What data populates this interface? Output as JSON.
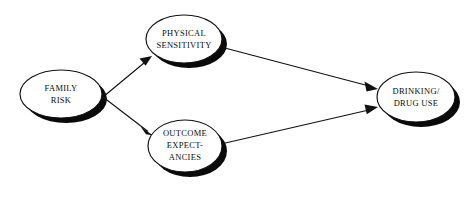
{
  "diagram": {
    "type": "path-diagram",
    "background_color": "#ffffff",
    "stroke_color": "#111111",
    "shadow_color": "#0a0a0a",
    "text_color": "#0d0d0d",
    "nodes": [
      {
        "id": "family-risk",
        "lines": [
          "FAMILY",
          "RISK"
        ],
        "cx": 61,
        "cy": 94,
        "rx": 41,
        "ry": 24,
        "shadow_dx": 5,
        "shadow_dy": 5
      },
      {
        "id": "physical-sensitivity",
        "lines": [
          "PHYSICAL",
          "SENSITIVITY"
        ],
        "cx": 184,
        "cy": 39,
        "rx": 38,
        "ry": 24,
        "shadow_dx": 5,
        "shadow_dy": 5
      },
      {
        "id": "outcome-expectancies",
        "lines": [
          "OUTCOME",
          "EXPECT-",
          "ANCIES"
        ],
        "cx": 185,
        "cy": 146,
        "rx": 37,
        "ry": 26,
        "shadow_dx": 5,
        "shadow_dy": 5
      },
      {
        "id": "drinking-drug-use",
        "lines": [
          "DRINKING/",
          "DRUG USE"
        ],
        "cx": 416,
        "cy": 97,
        "rx": 39,
        "ry": 25,
        "shadow_dx": 5,
        "shadow_dy": 5
      }
    ],
    "edges": [
      {
        "id": "family-risk-to-physical-sensitivity",
        "from": "family-risk",
        "to": "physical-sensitivity",
        "x1": 103,
        "y1": 97,
        "x2": 150,
        "y2": 58
      },
      {
        "id": "family-risk-to-outcome-expectancies",
        "from": "family-risk",
        "to": "outcome-expectancies",
        "x1": 103,
        "y1": 97,
        "x2": 151,
        "y2": 134
      },
      {
        "id": "physical-sensitivity-to-drinking-drug-use",
        "from": "physical-sensitivity",
        "to": "drinking-drug-use",
        "x1": 221,
        "y1": 47,
        "x2": 377,
        "y2": 88
      },
      {
        "id": "outcome-expectancies-to-drinking-drug-use",
        "from": "outcome-expectancies",
        "to": "drinking-drug-use",
        "x1": 221,
        "y1": 144,
        "x2": 377,
        "y2": 108
      }
    ]
  }
}
